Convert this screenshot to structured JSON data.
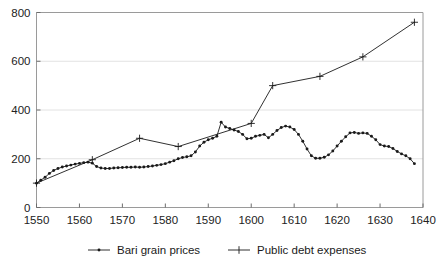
{
  "chart": {
    "title": "",
    "xlabel": "",
    "ylabel": ""
  },
  "legend": {
    "position": "bottom",
    "items": [
      {
        "label": "Bari grain prices",
        "marker": "dot-icon",
        "color": "#1a1a1a"
      },
      {
        "label": "Public debt expenses",
        "marker": "plus-icon",
        "color": "#1a1a1a"
      }
    ]
  },
  "axes": {
    "y_ticks": [
      "0",
      "200",
      "400",
      "600",
      "800"
    ],
    "x_ticks": [
      "1550",
      "1560",
      "1570",
      "1580",
      "1590",
      "1600",
      "1610",
      "1620",
      "1630",
      "1640"
    ]
  },
  "chart_data": {
    "type": "line",
    "title": "",
    "xlabel": "",
    "ylabel": "",
    "xlim": [
      1550,
      1640
    ],
    "ylim": [
      0,
      800
    ],
    "grid": true,
    "legend_position": "bottom",
    "series": [
      {
        "name": "Bari grain prices",
        "marker": "dot",
        "color": "#1a1a1a",
        "x": [
          1550,
          1551,
          1552,
          1553,
          1554,
          1555,
          1556,
          1557,
          1558,
          1559,
          1560,
          1561,
          1562,
          1563,
          1564,
          1565,
          1566,
          1567,
          1568,
          1569,
          1570,
          1571,
          1572,
          1573,
          1574,
          1575,
          1576,
          1577,
          1578,
          1579,
          1580,
          1581,
          1582,
          1583,
          1584,
          1585,
          1586,
          1587,
          1588,
          1589,
          1590,
          1591,
          1592,
          1593,
          1594,
          1595,
          1596,
          1597,
          1598,
          1599,
          1600,
          1601,
          1602,
          1603,
          1604,
          1605,
          1606,
          1607,
          1608,
          1609,
          1610,
          1611,
          1612,
          1613,
          1614,
          1615,
          1616,
          1617,
          1618,
          1619,
          1620,
          1621,
          1622,
          1623,
          1624,
          1625,
          1626,
          1627,
          1628,
          1629,
          1630,
          1631,
          1632,
          1633,
          1634,
          1635,
          1636,
          1637,
          1638
        ],
        "y": [
          100,
          112,
          124,
          140,
          152,
          160,
          166,
          170,
          174,
          178,
          181,
          184,
          186,
          182,
          168,
          162,
          160,
          160,
          162,
          163,
          164,
          165,
          165,
          166,
          165,
          166,
          168,
          170,
          173,
          176,
          180,
          186,
          192,
          200,
          205,
          208,
          212,
          228,
          252,
          268,
          278,
          284,
          292,
          350,
          330,
          324,
          318,
          312,
          300,
          282,
          284,
          292,
          296,
          300,
          286,
          300,
          316,
          328,
          334,
          330,
          320,
          300,
          272,
          240,
          212,
          202,
          202,
          206,
          216,
          232,
          252,
          272,
          290,
          306,
          308,
          304,
          306,
          304,
          292,
          278,
          258,
          252,
          250,
          242,
          230,
          220,
          212,
          200,
          180
        ]
      },
      {
        "name": "Public debt expenses",
        "marker": "plus",
        "color": "#1a1a1a",
        "x": [
          1550,
          1563,
          1574,
          1583,
          1600,
          1605,
          1616,
          1626,
          1638
        ],
        "y": [
          100,
          196,
          284,
          250,
          345,
          500,
          538,
          618,
          760
        ]
      }
    ]
  }
}
